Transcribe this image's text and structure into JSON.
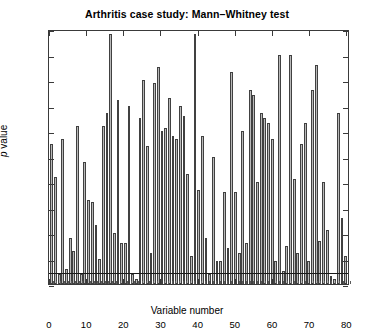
{
  "chart_data": {
    "type": "bar",
    "title": "Arthritis case study: Mann–Whitney test",
    "xlabel": "Variable number",
    "ylabel": "p value",
    "ylabel_italic_part": "p",
    "ylabel_rest": " value",
    "xlim": [
      0,
      81
    ],
    "ylim": [
      0,
      1
    ],
    "grid": false,
    "legend": null,
    "y_ticks": [
      0,
      0.1,
      0.2,
      0.3,
      0.4,
      0.5,
      0.6,
      0.7,
      0.8,
      0.9,
      1
    ],
    "y_tick_labels": [
      "0",
      "0.1",
      "0.2",
      "0.3",
      "0.4",
      "0.5",
      "0.6",
      "0.7",
      "0.8",
      "0.9",
      "1"
    ],
    "x_ticks": [
      0,
      10,
      20,
      30,
      40,
      50,
      60,
      70,
      80
    ],
    "x_tick_labels": [
      "0",
      "10",
      "20",
      "30",
      "40",
      "50",
      "60",
      "70",
      "80"
    ],
    "x_minor_tick_step": 1,
    "reference_line": {
      "y": 0.05,
      "label": "significance threshold"
    },
    "bar_fill_color": "#b9b9b9",
    "bar_edge_color": "#414141",
    "axes_color": "#3a3a3a",
    "background_color": "#ffffff",
    "categories": [
      1,
      2,
      3,
      4,
      5,
      6,
      7,
      8,
      9,
      10,
      11,
      12,
      13,
      14,
      15,
      16,
      17,
      18,
      19,
      20,
      21,
      22,
      23,
      24,
      25,
      26,
      27,
      28,
      29,
      30,
      31,
      32,
      33,
      34,
      35,
      36,
      37,
      38,
      39,
      40,
      41,
      42,
      43,
      44,
      45,
      46,
      47,
      48,
      49,
      50,
      51,
      52,
      53,
      54,
      55,
      56,
      57,
      58,
      59,
      60,
      61,
      62,
      63,
      64,
      65,
      66,
      67,
      68,
      69,
      70,
      71,
      72,
      73,
      74,
      75,
      76,
      77,
      78,
      79,
      80,
      81
    ],
    "values": [
      0.55,
      0.42,
      0.04,
      0.57,
      0.06,
      0.18,
      0.13,
      0.62,
      0.04,
      0.48,
      0.33,
      0.32,
      0.23,
      0.1,
      0.62,
      0.67,
      0.98,
      0.2,
      0.72,
      0.16,
      0.16,
      0.7,
      0.04,
      0.02,
      0.65,
      0.8,
      0.54,
      0.12,
      0.79,
      0.85,
      0.6,
      0.61,
      0.73,
      0.58,
      0.57,
      0.7,
      0.66,
      0.43,
      0.11,
      0.98,
      0.37,
      0.58,
      0.18,
      0.04,
      0.5,
      0.09,
      0.09,
      0.36,
      0.14,
      0.83,
      0.36,
      0.12,
      0.6,
      0.16,
      0.76,
      0.74,
      0.4,
      0.67,
      0.65,
      0.63,
      0.57,
      0.09,
      0.9,
      0.05,
      0.15,
      0.9,
      0.41,
      0.12,
      0.55,
      0.63,
      0.09,
      0.76,
      0.86,
      0.17,
      0.4,
      0.21,
      0.03,
      0.02,
      0.67,
      0.26,
      0.11
    ]
  }
}
